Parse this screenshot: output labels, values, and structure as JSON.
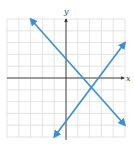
{
  "chart_data": {
    "type": "line",
    "title": "",
    "xlabel": "x",
    "ylabel": "y",
    "xlim": [
      -5,
      5
    ],
    "ylim": [
      -5,
      5
    ],
    "grid": true,
    "tick_labels": false,
    "series": [
      {
        "name": "decreasing line",
        "x": [
          -3,
          5
        ],
        "y": [
          5,
          -4
        ],
        "arrows": "both",
        "color": "#3a8fd0"
      },
      {
        "name": "increasing line",
        "x": [
          -1,
          5
        ],
        "y": [
          -5,
          3
        ],
        "arrows": "both",
        "color": "#3a8fd0"
      }
    ],
    "intersection": {
      "x": 2,
      "y": -1
    }
  },
  "colors": {
    "line": "#3a8fd0",
    "grid": "#dcdcdc",
    "axis": "#333333"
  }
}
